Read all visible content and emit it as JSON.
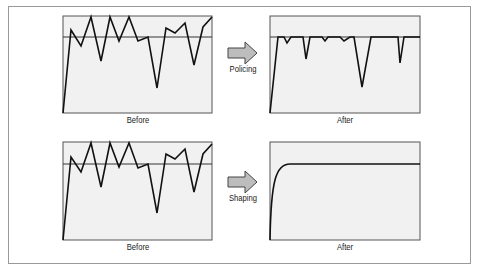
{
  "diagram": {
    "rows": [
      {
        "name": "policing",
        "before_label": "Before",
        "after_label": "After",
        "arrow_label": "Policing"
      },
      {
        "name": "shaping",
        "before_label": "Before",
        "after_label": "After",
        "arrow_label": "Shaping"
      }
    ],
    "colors": {
      "panel_fill": "#f1f1f1",
      "panel_border": "#555555",
      "line": "#111111",
      "threshold": "#333333",
      "arrow_fill": "#bdbdbd",
      "frame": "#9a9a9a"
    }
  }
}
